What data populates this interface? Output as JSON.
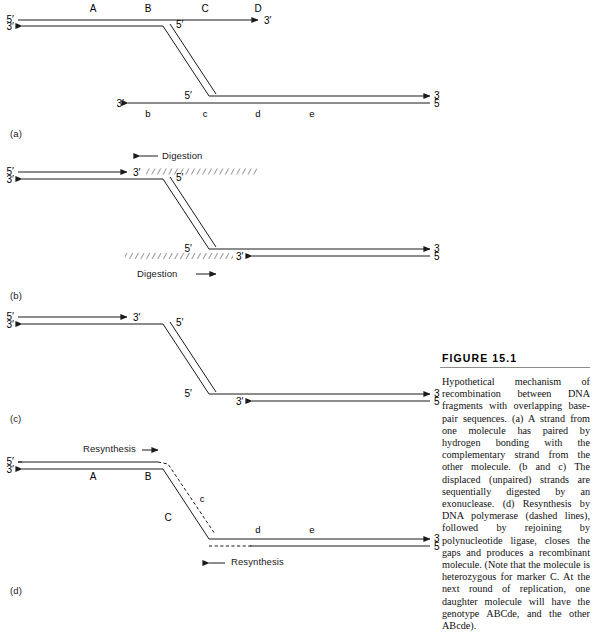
{
  "figure": {
    "heading": "FIGURE 15.1",
    "caption": "Hypothetical mechanism of recombination between DNA fragments with overlapping base-pair sequences. (a) A strand from one molecule has paired by hydrogen bonding with the complementary strand from the other molecule. (b and c) The displaced (unpaired) strands are sequentially digested by an exonuclease. (d) Resynthesis by DNA polymerase (dashed lines), followed by rejoining by polynucleotide ligase, closes the gaps and produces a recombinant molecule. (Note that the molecule is heterozygous for marker C. At the next round of replication, one daughter molecule will have the genotype ABCde, and the other ABcde)."
  },
  "strand_ends": {
    "five_prime": "5′",
    "three_prime": "3′"
  },
  "panels": [
    {
      "id": "a",
      "label": "(a)",
      "markers_top": [
        "A",
        "B",
        "C",
        "D"
      ],
      "markers_bottom": [
        "b",
        "c",
        "d",
        "e"
      ],
      "end_labels": {
        "upper_left_top": "5′",
        "upper_left_bottom": "3′",
        "upper_right": "3′",
        "crossover_top": "5′",
        "crossover_bottom": "5′",
        "lower_left": "3′",
        "lower_right_top": "3′",
        "lower_right_bottom": "5′"
      }
    },
    {
      "id": "b",
      "label": "(b)",
      "annotations": [
        {
          "name": "digestion-top",
          "text": "Digestion",
          "direction": "left"
        },
        {
          "name": "digestion-bottom",
          "text": "Digestion",
          "direction": "right"
        }
      ],
      "end_labels": {
        "upper_left_top": "5′",
        "upper_left_bottom": "3′",
        "upper_right": "3′",
        "crossover_top": "5′",
        "crossover_bottom": "5′",
        "lower_left": "3′",
        "lower_right_top": "3′",
        "lower_right_bottom": "5′"
      }
    },
    {
      "id": "c",
      "label": "(c)",
      "end_labels": {
        "upper_left_top": "5′",
        "upper_left_bottom": "3′",
        "upper_right": "3′",
        "crossover_top": "5′",
        "crossover_bottom": "5′",
        "lower_left": "3′",
        "lower_right_top": "3′",
        "lower_right_bottom": "5′"
      }
    },
    {
      "id": "d",
      "label": "(d)",
      "markers": [
        "A",
        "B",
        "C",
        "c",
        "d",
        "e"
      ],
      "annotations": [
        {
          "name": "resynthesis-top",
          "text": "Resynthesis",
          "direction": "right"
        },
        {
          "name": "resynthesis-bottom",
          "text": "Resynthesis",
          "direction": "left"
        }
      ],
      "end_labels": {
        "upper_left_top": "5′",
        "upper_left_bottom": "3′",
        "lower_right_top": "3′",
        "lower_right_bottom": "5′"
      }
    }
  ]
}
